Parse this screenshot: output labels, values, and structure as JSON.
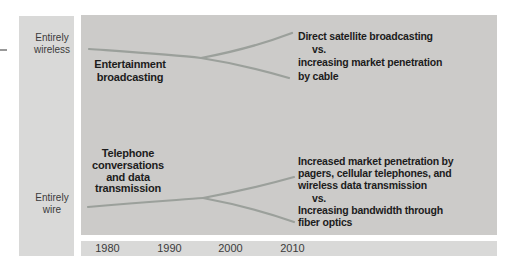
{
  "colors": {
    "plot_bg": "#cccbc9",
    "panel_bg": "#d9d9d8",
    "curve": "#9ba09b",
    "annotation_text": "#1c1c1c",
    "axis_text": "#3b3b3b"
  },
  "y_axis": {
    "top_label": "Entirely\nwireless",
    "bottom_label": "Entirely\nwire"
  },
  "x_axis": {
    "ticks": [
      "1980",
      "1990",
      "2000",
      "2010"
    ]
  },
  "annotations": {
    "entertainment": "Entertainment\nbroadcasting",
    "telephone": "Telephone\nconversations\nand data\ntransmission",
    "top_right": [
      "Direct satellite broadcasting",
      "vs.",
      "increasing market penetration",
      "by cable"
    ],
    "bottom_right": [
      "Increased market penetration by",
      "pagers, cellular telephones, and",
      "wireless data transmission",
      "vs.",
      "Increasing bandwidth through",
      "fiber optics"
    ]
  },
  "curves": {
    "entertainment_main": "M 89,49 C 145,53 175,55 201,58",
    "satellite_branch": "M 201,58 C 233,52 263,44 292,33",
    "cable_branch": "M 201,58 C 233,63 262,70 289,78",
    "telephone_main": "M 88,207 C 145,202 178,200 203,198",
    "wireless_branch": "M 203,198 C 235,192 266,185 294,177",
    "fiber_branch": "M 203,198 C 235,204 266,212 294,222",
    "left_edge_tick": "M 0,50 L 7,50"
  }
}
